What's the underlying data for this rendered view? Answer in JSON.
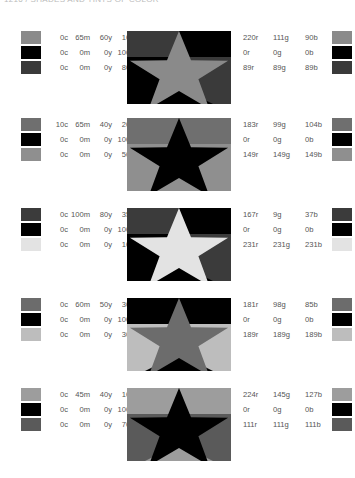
{
  "header": {
    "title": "1216 / SHADES AND TINTS OF COLOR"
  },
  "rows": [
    {
      "swatches": [
        {
          "cmyk": [
            "0c",
            "65m",
            "60y",
            "10k"
          ],
          "rgb": [
            "220r",
            "111g",
            "90b"
          ],
          "hex": "#8a8a8a"
        },
        {
          "cmyk": [
            "0c",
            "0m",
            "0y",
            "100k"
          ],
          "rgb": [
            "0r",
            "0g",
            "0b"
          ],
          "hex": "#000000"
        },
        {
          "cmyk": [
            "0c",
            "0m",
            "0y",
            "80k"
          ],
          "rgb": [
            "89r",
            "89g",
            "89b"
          ],
          "hex": "#3a3a3a"
        }
      ],
      "star": {
        "tl": "#3a3a3a",
        "tr": "#000000",
        "bl": "#000000",
        "br": "#3a3a3a",
        "notch": "#000000",
        "fill": "#8a8a8a"
      }
    },
    {
      "swatches": [
        {
          "cmyk": [
            "10c",
            "65m",
            "40y",
            "20k"
          ],
          "rgb": [
            "183r",
            "99g",
            "104b"
          ],
          "hex": "#6f6f6f"
        },
        {
          "cmyk": [
            "0c",
            "0m",
            "0y",
            "100k"
          ],
          "rgb": [
            "0r",
            "0g",
            "0b"
          ],
          "hex": "#000000"
        },
        {
          "cmyk": [
            "0c",
            "0m",
            "0y",
            "50k"
          ],
          "rgb": [
            "149r",
            "149g",
            "149b"
          ],
          "hex": "#8f8f8f"
        }
      ],
      "star": {
        "tl": "#6f6f6f",
        "tr": "#6f6f6f",
        "bl": "#8f8f8f",
        "br": "#8f8f8f",
        "notch": "#8f8f8f",
        "fill": "#000000"
      }
    },
    {
      "swatches": [
        {
          "cmyk": [
            "0c",
            "100m",
            "80y",
            "35k"
          ],
          "rgb": [
            "167r",
            "9g",
            "37b"
          ],
          "hex": "#3b3b3b"
        },
        {
          "cmyk": [
            "0c",
            "0m",
            "0y",
            "100k"
          ],
          "rgb": [
            "0r",
            "0g",
            "0b"
          ],
          "hex": "#000000"
        },
        {
          "cmyk": [
            "0c",
            "0m",
            "0y",
            "10k"
          ],
          "rgb": [
            "231r",
            "231g",
            "231b"
          ],
          "hex": "#e3e3e3"
        }
      ],
      "star": {
        "tl": "#3b3b3b",
        "tr": "#000000",
        "bl": "#000000",
        "br": "#3b3b3b",
        "notch": "#000000",
        "fill": "#e3e3e3"
      }
    },
    {
      "swatches": [
        {
          "cmyk": [
            "0c",
            "60m",
            "50y",
            "30k"
          ],
          "rgb": [
            "181r",
            "98g",
            "85b"
          ],
          "hex": "#6c6c6c"
        },
        {
          "cmyk": [
            "0c",
            "0m",
            "0y",
            "100k"
          ],
          "rgb": [
            "0r",
            "0g",
            "0b"
          ],
          "hex": "#000000"
        },
        {
          "cmyk": [
            "0c",
            "0m",
            "0y",
            "30k"
          ],
          "rgb": [
            "189r",
            "189g",
            "189b"
          ],
          "hex": "#bdbdbd"
        }
      ],
      "star": {
        "tl": "#000000",
        "tr": "#000000",
        "bl": "#bdbdbd",
        "br": "#bdbdbd",
        "notch": "#000000",
        "fill": "#6c6c6c"
      }
    },
    {
      "swatches": [
        {
          "cmyk": [
            "0c",
            "45m",
            "40y",
            "10k"
          ],
          "rgb": [
            "224r",
            "145g",
            "127b"
          ],
          "hex": "#9d9d9d"
        },
        {
          "cmyk": [
            "0c",
            "0m",
            "0y",
            "100k"
          ],
          "rgb": [
            "0r",
            "0g",
            "0b"
          ],
          "hex": "#000000"
        },
        {
          "cmyk": [
            "0c",
            "0m",
            "0y",
            "70k"
          ],
          "rgb": [
            "111r",
            "111g",
            "111b"
          ],
          "hex": "#5a5a5a"
        }
      ],
      "star": {
        "tl": "#9d9d9d",
        "tr": "#9d9d9d",
        "bl": "#5a5a5a",
        "br": "#5a5a5a",
        "notch": "#9d9d9d",
        "fill": "#000000"
      }
    }
  ]
}
